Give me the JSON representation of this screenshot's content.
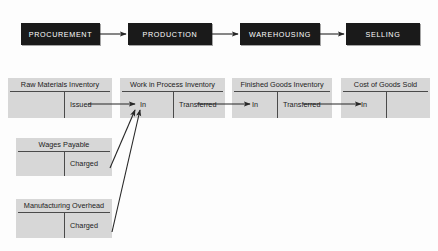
{
  "diagram": {
    "process_boxes": [
      {
        "label": "PROCUREMENT",
        "x": 21,
        "y": 23,
        "w": 79,
        "h": 22
      },
      {
        "label": "PRODUCTION",
        "x": 128,
        "y": 23,
        "w": 84,
        "h": 22
      },
      {
        "label": "WAREHOUSING",
        "x": 240,
        "y": 23,
        "w": 80,
        "h": 22
      },
      {
        "label": "SELLING",
        "x": 346,
        "y": 23,
        "w": 74,
        "h": 22
      }
    ],
    "process_arrows": [
      {
        "from": "PROCUREMENT",
        "to": "PRODUCTION",
        "x1": 100,
        "y1": 34,
        "x2": 126,
        "y2": 34
      },
      {
        "from": "PRODUCTION",
        "to": "WAREHOUSING",
        "x1": 212,
        "y1": 34,
        "x2": 238,
        "y2": 34
      },
      {
        "from": "WAREHOUSING",
        "to": "SELLING",
        "x1": 320,
        "y1": 34,
        "x2": 344,
        "y2": 34
      }
    ],
    "t_accounts": [
      {
        "id": "raw-materials-inventory",
        "title": "Raw Materials Inventory",
        "debit_label": "",
        "credit_label": "Issued",
        "x": 8,
        "y": 78,
        "w": 104,
        "h": 40,
        "divider": 56
      },
      {
        "id": "work-in-process-inventory",
        "title": "Work in Process Inventory",
        "debit_label": "In",
        "credit_label": "Transferred",
        "x": 120,
        "y": 78,
        "w": 105,
        "h": 40,
        "divider": 53
      },
      {
        "id": "finished-goods-inventory",
        "title": "Finished Goods Inventory",
        "debit_label": "In",
        "credit_label": "Transferred",
        "x": 232,
        "y": 78,
        "w": 100,
        "h": 40,
        "divider": 45
      },
      {
        "id": "cost-of-goods-sold",
        "title": "Cost of Goods Sold",
        "debit_label": "In",
        "credit_label": "",
        "x": 341,
        "y": 78,
        "w": 89,
        "h": 40,
        "divider": 45
      },
      {
        "id": "wages-payable",
        "title": "Wages Payable",
        "debit_label": "",
        "credit_label": "Charged",
        "x": 16,
        "y": 138,
        "w": 96,
        "h": 38,
        "divider": 48
      },
      {
        "id": "manufacturing-overhead",
        "title": "Manufacturing Overhead",
        "debit_label": "",
        "credit_label": "Charged",
        "x": 16,
        "y": 199,
        "w": 96,
        "h": 39,
        "divider": 48
      }
    ],
    "flow_arrows": [
      {
        "id": "issued-to-wip-in",
        "x1": 88,
        "y1": 104,
        "x2": 135,
        "y2": 104
      },
      {
        "id": "wip-transferred-to-fg-in",
        "x1": 197,
        "y1": 104,
        "x2": 250,
        "y2": 104
      },
      {
        "id": "fg-transferred-to-cogs-in",
        "x1": 303,
        "y1": 104,
        "x2": 361,
        "y2": 104
      },
      {
        "id": "wages-charged-to-wip-in",
        "x1": 110,
        "y1": 168,
        "x2": 135,
        "y2": 110
      },
      {
        "id": "overhead-charged-to-wip-in",
        "x1": 112,
        "y1": 232,
        "x2": 140,
        "y2": 110
      }
    ],
    "colors": {
      "process_box_fill": "#1a1a1a",
      "process_box_text": "#ffffff",
      "t_account_fill": "#d7d7d7",
      "rule": "#4a4a4a",
      "arrow": "#262626",
      "background": "#fdfdfd"
    }
  }
}
